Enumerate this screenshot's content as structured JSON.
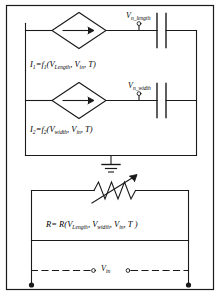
{
  "diagram": {
    "stroke_color": "#1a1a1a",
    "background": "#ffffff"
  },
  "branches": [
    {
      "id": "branch-length",
      "source_symbol": "diamond-current-source",
      "arrow_direction": "right",
      "node_label": {
        "base": "V",
        "subscript": "n_length",
        "full": "V n_length"
      },
      "equation": {
        "lhs_base": "I",
        "lhs_sub": "1",
        "eq": "=",
        "fn_base": "f",
        "fn_sub": "1",
        "open": "(",
        "args": [
          "V Length",
          "V in",
          "T"
        ],
        "close": ")",
        "full": "I1=f1(VLength, Vin, T )"
      },
      "element": "capacitor"
    },
    {
      "id": "branch-width",
      "source_symbol": "diamond-current-source",
      "arrow_direction": "right",
      "node_label": {
        "base": "V",
        "subscript": "n_width",
        "full": "V n_width"
      },
      "equation": {
        "lhs_base": "I",
        "lhs_sub": "2",
        "eq": "=",
        "fn_base": "f",
        "fn_sub": "2",
        "open": "(",
        "args": [
          "V width",
          "V in",
          "T"
        ],
        "close": ")",
        "full": "I2=f2(Vwidth, Vin, T )"
      },
      "element": "capacitor"
    }
  ],
  "ground": {
    "symbol": "earth-ground",
    "label": ""
  },
  "resistor": {
    "id": "variable-resistor",
    "symbol": "variable-resistor-zigzag-arrow",
    "equation": {
      "lhs": "R",
      "eq": "=",
      "fn": "R",
      "open": "(",
      "args": [
        "V Length",
        "V width",
        "V in",
        "T"
      ],
      "close": ")",
      "full": "R= R(VLength, Vwidth, Vin, T )"
    }
  },
  "input": {
    "id": "vin-port",
    "label_base": "V",
    "label_sub": "in",
    "full": "Vin",
    "line_style": "dashed",
    "left_terminal": "filled-dot",
    "right_terminal": "filled-dot",
    "left_port": "open-circle",
    "right_port": "open-circle"
  },
  "equation_parts": {
    "i1": {
      "base": "I",
      "sub": "1",
      "f": "f",
      "fsub": "1"
    },
    "i2": {
      "base": "I",
      "sub": "2",
      "f": "f",
      "fsub": "2"
    },
    "v": "V",
    "sub_length": "Length",
    "sub_width": "width",
    "sub_in": "in",
    "t": "T",
    "eq": "=",
    "open": "(",
    "close": ")",
    "comma": ",",
    "r": "R",
    "script_r": "R"
  }
}
